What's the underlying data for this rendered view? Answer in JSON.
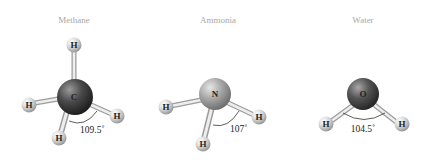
{
  "molecules": [
    {
      "name": "Methane",
      "central_atom": "C",
      "central_color": "#3a3a3a",
      "hydrogen_label": "H",
      "bond_angle": "109.5˚"
    },
    {
      "name": "Ammonia",
      "central_atom": "N",
      "central_color": "#9a9a9a",
      "hydrogen_label": "H",
      "bond_angle": "107˚"
    },
    {
      "name": "Water",
      "central_atom": "O",
      "central_color": "#4a4a4a",
      "hydrogen_label": "H",
      "bond_angle": "104.5˚"
    }
  ],
  "colors": {
    "hydrogen": "#d8d8d8",
    "bond": "#c8c8c8",
    "title": "#a8a8a8"
  }
}
